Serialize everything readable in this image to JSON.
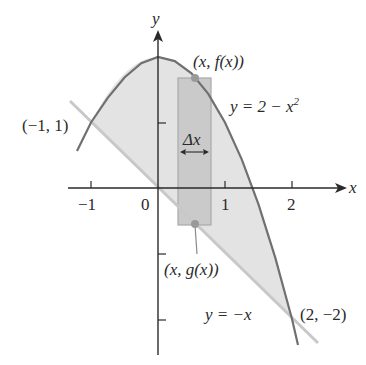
{
  "figure": {
    "axes": {
      "x_label": "x",
      "y_label": "y",
      "x_ticks": [
        {
          "value": -1,
          "label": "−1"
        },
        {
          "value": 0,
          "label": "0"
        },
        {
          "value": 1,
          "label": "1"
        },
        {
          "value": 2,
          "label": "2"
        }
      ],
      "y_ticks": [
        1,
        -1,
        -2
      ]
    },
    "curves": {
      "upper": {
        "label": "y = 2 − x",
        "exponent": "2",
        "equation": "f(x) = 2 − x^2"
      },
      "lower": {
        "label": "y = −x",
        "equation": "g(x) = −x"
      }
    },
    "points": {
      "left_intersection": "(−1, 1)",
      "right_intersection": "(2, −2)",
      "top_point": "(x, f(x))",
      "bottom_point": "(x, g(x))"
    },
    "strip": {
      "width_label": "Δx"
    },
    "colors": {
      "region_fill": "#e0e0e0",
      "strip_fill": "#c9c9c9",
      "parabola": "#6e6e6e",
      "line": "#c4c4c4",
      "axis": "#2a2a2a",
      "dot": "#9a9a9a"
    }
  }
}
